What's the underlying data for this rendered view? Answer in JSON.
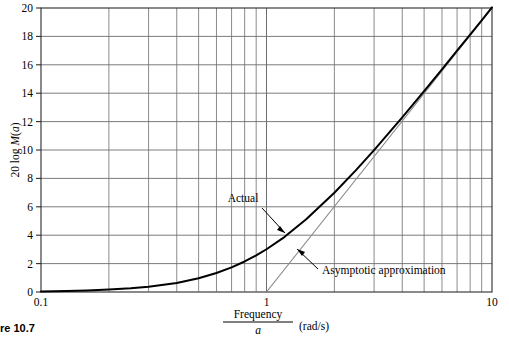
{
  "figure": {
    "caption": "re 10.7",
    "caption_full_hint": "Figure 10.7"
  },
  "axes": {
    "y_label": "20 log M(a)",
    "y_label_parts": {
      "prefix": "20 log",
      "function": "M",
      "argument": "a"
    },
    "x_label_numerator": "Frequency",
    "x_label_denominator": "a",
    "x_label_units": "(rad/s)",
    "x_tick_labels": [
      "0.1",
      "1",
      "10"
    ],
    "y_tick_labels": [
      "0",
      "2",
      "4",
      "6",
      "8",
      "10",
      "12",
      "14",
      "16",
      "18",
      "20"
    ]
  },
  "annotations": [
    {
      "id": "actual",
      "label": "Actual"
    },
    {
      "id": "asymptotic",
      "label": "Asymptotic approximation"
    }
  ],
  "colors": {
    "actual_curve": "#000000",
    "asymptote": "#8a8a8a",
    "grid": "#6d6d6d",
    "axis": "#2b2b2b",
    "background": "#ffffff",
    "text": "#000000"
  },
  "chart_data": {
    "type": "line",
    "title": "",
    "subtitle": "",
    "xlabel": "Frequency / a (rad/s)",
    "ylabel": "20 log M(a)",
    "xscale": "log",
    "yscale": "linear",
    "xlim": [
      0.1,
      10
    ],
    "ylim": [
      0,
      20
    ],
    "grid": true,
    "legend_position": "inline-annotations",
    "x_major_ticks": [
      0.1,
      1,
      10
    ],
    "x_minor_ticks": [
      0.2,
      0.3,
      0.4,
      0.5,
      0.6,
      0.7,
      0.8,
      0.9,
      2,
      3,
      4,
      5,
      6,
      7,
      8,
      9
    ],
    "y_ticks": [
      0,
      2,
      4,
      6,
      8,
      10,
      12,
      14,
      16,
      18,
      20
    ],
    "series": [
      {
        "name": "Actual",
        "color": "#000000",
        "width": 2.0,
        "description": "20 log10( sqrt(1 + (w/a)^2) )",
        "x": [
          0.1,
          0.13,
          0.16,
          0.2,
          0.25,
          0.3,
          0.4,
          0.5,
          0.6,
          0.7,
          0.8,
          0.9,
          1.0,
          1.2,
          1.5,
          2.0,
          2.5,
          3.0,
          4.0,
          5.0,
          6.0,
          7.0,
          8.0,
          9.0,
          10.0
        ],
        "y": [
          0.04,
          0.07,
          0.11,
          0.17,
          0.26,
          0.37,
          0.64,
          0.97,
          1.34,
          1.73,
          2.15,
          2.58,
          3.01,
          3.87,
          5.12,
          6.99,
          8.6,
          9.99,
          12.3,
          14.15,
          15.68,
          17.0,
          18.13,
          19.13,
          20.04
        ]
      },
      {
        "name": "Asymptotic approximation",
        "color": "#8a8a8a",
        "width": 1.2,
        "description": "0 dB for w<a; +20 dB/decade for w>a",
        "x": [
          0.1,
          1.0,
          10.0
        ],
        "y": [
          0.0,
          0.0,
          20.0
        ]
      }
    ],
    "notes": [
      "Break (corner) frequency at w/a = 1",
      "Actual curve is 3 dB above asymptote at the corner",
      "High-frequency slope is +20 dB/decade"
    ]
  }
}
